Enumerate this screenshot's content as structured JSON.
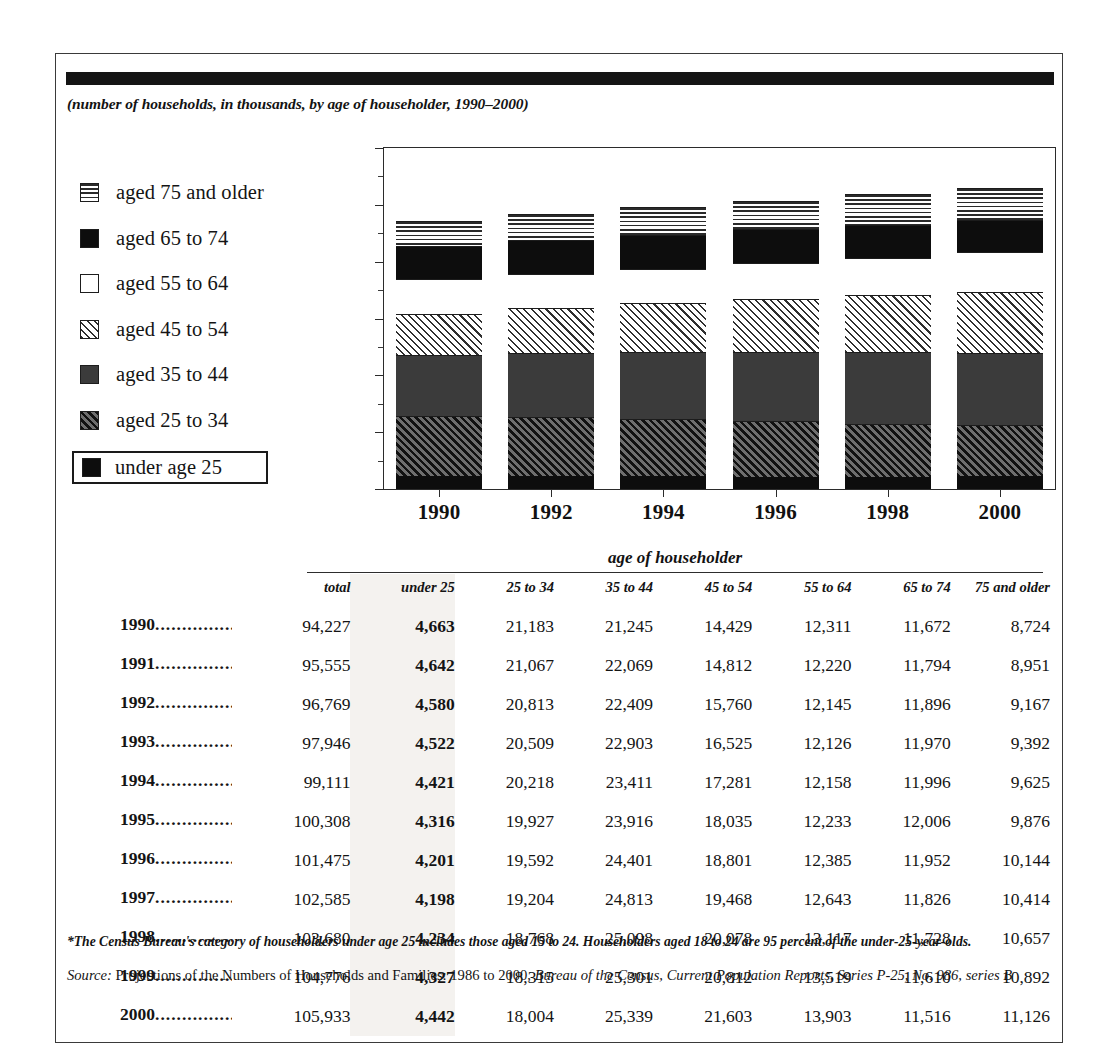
{
  "figure": {
    "subtitle": "(number of households, in thousands, by age of householder, 1990–2000)",
    "footnote": "*The Census Bureau's category of householders under age 25 includes those aged 15 to 24. Householders aged 18 to 24 are 95 percent of the under-25-year-olds.",
    "source_label": "Source:",
    "source_plain": " Projections of the Numbers of Households and Families: 1986 to 2000, ",
    "source_italic": "Bureau of the Census, Current Population Reports, Series P-25, No. 986, series B"
  },
  "legend": {
    "items": [
      {
        "label": "aged 75 and older",
        "swatch": "horizontal-lines-swatch",
        "fill": "fill-hlines",
        "boxed": false
      },
      {
        "label": "aged 65 to 74",
        "swatch": "solid-black-swatch",
        "fill": "fill-black",
        "boxed": false
      },
      {
        "label": "aged 55 to 64",
        "swatch": "white-swatch",
        "fill": "fill-white",
        "boxed": false
      },
      {
        "label": "aged 45 to 54",
        "swatch": "light-diagonal-hatch-swatch",
        "fill": "fill-lighthatch",
        "boxed": false
      },
      {
        "label": "aged 35 to 44",
        "swatch": "dark-gray-swatch",
        "fill": "fill-darkgray",
        "boxed": false
      },
      {
        "label": "aged 25 to 34",
        "swatch": "dark-diagonal-hatch-swatch",
        "fill": "fill-darkhatch",
        "boxed": false
      },
      {
        "label": "under age 25",
        "swatch": "solid-black-swatch",
        "fill": "fill-black",
        "boxed": true
      }
    ]
  },
  "chart_data": {
    "type": "bar",
    "stacked": true,
    "title": "",
    "subtitle": "(number of households, in thousands, by age of householder, 1990–2000)",
    "xlabel": "",
    "ylabel": "",
    "ylim": [
      0,
      120000
    ],
    "ytick_values": [
      0,
      20000,
      40000,
      60000,
      80000,
      100000,
      120000
    ],
    "ytick_labels": [
      "0",
      "20,000",
      "40,000",
      "60,000",
      "80,000",
      "100,000",
      "120,000"
    ],
    "yminor_values": [
      10000,
      30000,
      50000,
      70000,
      90000,
      110000
    ],
    "grid": false,
    "legend_position": "left",
    "categories": [
      "1990",
      "1992",
      "1994",
      "1996",
      "1998",
      "2000"
    ],
    "series": [
      {
        "name": "under age 25",
        "fill": "fill-black",
        "values": [
          4663,
          4580,
          4421,
          4201,
          4234,
          4442
        ]
      },
      {
        "name": "aged 25 to 34",
        "fill": "fill-darkhatch",
        "values": [
          21183,
          20813,
          20218,
          19592,
          18768,
          18004
        ]
      },
      {
        "name": "aged 35 to 44",
        "fill": "fill-darkgray",
        "values": [
          21245,
          22409,
          23411,
          24401,
          25098,
          25339
        ]
      },
      {
        "name": "aged 45 to 54",
        "fill": "fill-lighthatch",
        "values": [
          14429,
          15760,
          17281,
          18801,
          20078,
          21603
        ]
      },
      {
        "name": "aged 55 to 64",
        "fill": "fill-white",
        "values": [
          12311,
          12145,
          12158,
          12385,
          13117,
          13903
        ]
      },
      {
        "name": "aged 65 to 74",
        "fill": "fill-black",
        "values": [
          11672,
          11896,
          11996,
          11952,
          11728,
          11516
        ]
      },
      {
        "name": "aged 75 and older",
        "fill": "fill-hlines",
        "values": [
          8724,
          9167,
          9625,
          10144,
          10657,
          11126
        ]
      }
    ],
    "totals": [
      94227,
      96769,
      99111,
      101475,
      103680,
      105933
    ]
  },
  "table": {
    "group_header": "age of householder",
    "columns": [
      "",
      "total",
      "under 25",
      "25 to 34",
      "35 to 44",
      "45 to 54",
      "55 to 64",
      "65 to 74",
      "75 and older"
    ],
    "dot_leader": "...............",
    "rows": [
      {
        "year": "1990",
        "total": "94,227",
        "under25": "4,663",
        "a25_34": "21,183",
        "a35_44": "21,245",
        "a45_54": "14,429",
        "a55_64": "12,311",
        "a65_74": "11,672",
        "a75p": "8,724"
      },
      {
        "year": "1991",
        "total": "95,555",
        "under25": "4,642",
        "a25_34": "21,067",
        "a35_44": "22,069",
        "a45_54": "14,812",
        "a55_64": "12,220",
        "a65_74": "11,794",
        "a75p": "8,951"
      },
      {
        "year": "1992",
        "total": "96,769",
        "under25": "4,580",
        "a25_34": "20,813",
        "a35_44": "22,409",
        "a45_54": "15,760",
        "a55_64": "12,145",
        "a65_74": "11,896",
        "a75p": "9,167"
      },
      {
        "year": "1993",
        "total": "97,946",
        "under25": "4,522",
        "a25_34": "20,509",
        "a35_44": "22,903",
        "a45_54": "16,525",
        "a55_64": "12,126",
        "a65_74": "11,970",
        "a75p": "9,392"
      },
      {
        "year": "1994",
        "total": "99,111",
        "under25": "4,421",
        "a25_34": "20,218",
        "a35_44": "23,411",
        "a45_54": "17,281",
        "a55_64": "12,158",
        "a65_74": "11,996",
        "a75p": "9,625"
      },
      {
        "year": "1995",
        "total": "100,308",
        "under25": "4,316",
        "a25_34": "19,927",
        "a35_44": "23,916",
        "a45_54": "18,035",
        "a55_64": "12,233",
        "a65_74": "12,006",
        "a75p": "9,876"
      },
      {
        "year": "1996",
        "total": "101,475",
        "under25": "4,201",
        "a25_34": "19,592",
        "a35_44": "24,401",
        "a45_54": "18,801",
        "a55_64": "12,385",
        "a65_74": "11,952",
        "a75p": "10,144"
      },
      {
        "year": "1997",
        "total": "102,585",
        "under25": "4,198",
        "a25_34": "19,204",
        "a35_44": "24,813",
        "a45_54": "19,468",
        "a55_64": "12,643",
        "a65_74": "11,826",
        "a75p": "10,414"
      },
      {
        "year": "1998",
        "total": "103,680",
        "under25": "4,234",
        "a25_34": "18,768",
        "a35_44": "25,098",
        "a45_54": "20,078",
        "a55_64": "13,117",
        "a65_74": "11,728",
        "a75p": "10,657"
      },
      {
        "year": "1999",
        "total": "104,776",
        "under25": "4,327",
        "a25_34": "18,315",
        "a35_44": "25,301",
        "a45_54": "20,812",
        "a55_64": "13,519",
        "a65_74": "11,610",
        "a75p": "10,892"
      },
      {
        "year": "2000",
        "total": "105,933",
        "under25": "4,442",
        "a25_34": "18,004",
        "a35_44": "25,339",
        "a45_54": "21,603",
        "a55_64": "13,903",
        "a65_74": "11,516",
        "a75p": "11,126"
      }
    ]
  },
  "colors": {
    "ink": "#141414",
    "rule": "#141414",
    "highlight_column": "#f4f2ef"
  }
}
